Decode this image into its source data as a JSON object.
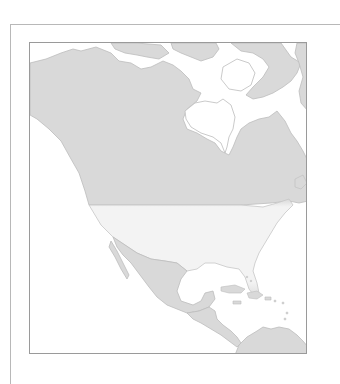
{
  "map": {
    "title": "North America",
    "highlighted_region": "United States",
    "regions": [
      {
        "name": "Canada",
        "fill": "#d9d9d9"
      },
      {
        "name": "United States",
        "fill": "#f3f3f3",
        "highlighted": true
      },
      {
        "name": "Mexico",
        "fill": "#d9d9d9"
      },
      {
        "name": "Central America",
        "fill": "#d9d9d9"
      },
      {
        "name": "Caribbean",
        "fill": "#d9d9d9"
      },
      {
        "name": "South America (north)",
        "fill": "#d9d9d9"
      },
      {
        "name": "Greenland / Arctic Islands",
        "fill": "#d9d9d9"
      }
    ],
    "colors": {
      "land": "#d9d9d9",
      "highlight": "#f3f3f3",
      "water": "#ffffff",
      "coastline": "#bdbdbd",
      "frame": "#9a9a9a"
    }
  }
}
